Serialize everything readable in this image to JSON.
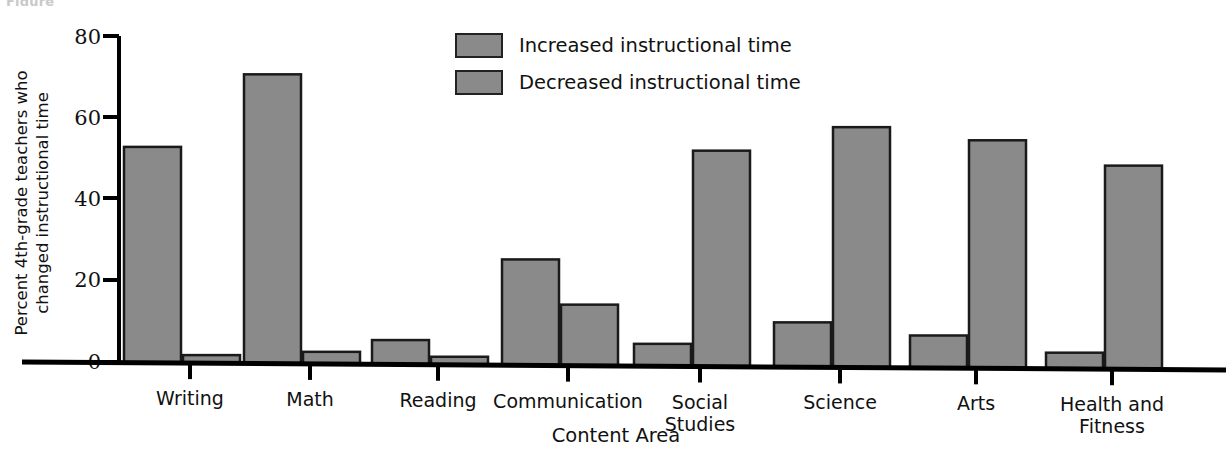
{
  "figure": {
    "caption_remnant": "Figure",
    "background_color": "#ffffff"
  },
  "chart_data": {
    "type": "bar",
    "title": "",
    "subtitle": "",
    "xlabel": "Content Area",
    "ylabel": "Percent 4th-grade teachers who\nchanged instructional time",
    "categories": [
      "Writing",
      "Math",
      "Reading",
      "Communication",
      "Social\nStudies",
      "Science",
      "Arts",
      "Health and\nFitness"
    ],
    "series": [
      {
        "name": "Increased instructional time",
        "color": "#8a8a8a",
        "values": [
          53,
          71,
          6,
          26,
          5.5,
          11,
          8,
          4
        ]
      },
      {
        "name": "Decreased instructional time",
        "color": "#8a8a8a",
        "values": [
          2,
          3,
          2,
          15,
          53,
          59,
          56,
          50
        ]
      }
    ],
    "ylim": [
      0,
      80
    ],
    "yticks": [
      0,
      20,
      40,
      60,
      80
    ],
    "ytick_labels": [
      "0",
      "20",
      "40",
      "60",
      "80"
    ],
    "grid": false,
    "legend_position": "top-center",
    "bar_edge_color": "#1a1a1a",
    "axis_color": "#000000"
  },
  "legend": {
    "entries": [
      {
        "label": "Increased instructional time",
        "color": "#8a8a8a"
      },
      {
        "label": "Decreased instructional time",
        "color": "#8a8a8a"
      }
    ]
  }
}
